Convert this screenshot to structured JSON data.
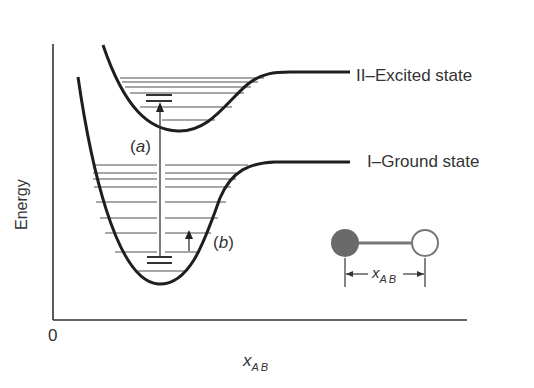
{
  "diagram": {
    "axes": {
      "y_label": "Energy",
      "x_label_main": "x",
      "x_label_sub": "AB",
      "origin_label": "0"
    },
    "curves": [
      {
        "id": "excited",
        "label": "II–Excited state",
        "levels_count": 6,
        "highlighted_level": "lowest vibrational level (double bar)"
      },
      {
        "id": "ground",
        "label": "I–Ground state",
        "levels_count": 9,
        "highlighted_level": "lowest vibrational level (double bar)"
      }
    ],
    "transitions": [
      {
        "label": "(a)",
        "letter": "a",
        "description": "electronic transition from ground to excited state"
      },
      {
        "label": "(b)",
        "letter": "b",
        "description": "vibrational transition within ground state"
      }
    ],
    "inset": {
      "atom_a": "filled circle",
      "atom_b": "open circle",
      "distance_label_main": "x",
      "distance_label_sub": "AB"
    },
    "colors": {
      "curve": "#1e1e1e",
      "levels": "#8a8a8a",
      "atom_filled": "#6a6a6a",
      "text": "#333333"
    }
  }
}
